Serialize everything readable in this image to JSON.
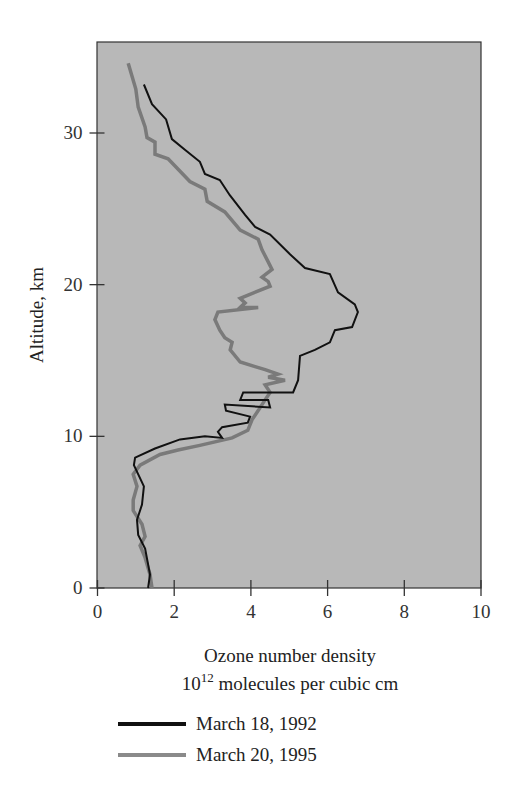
{
  "chart_data": {
    "type": "line",
    "title": "",
    "xlabel": "Ozone number density",
    "xlabel_line2_base": "10",
    "xlabel_line2_exp": "12",
    "xlabel_line2_rest": " molecules per cubic cm",
    "ylabel": "Altitude, km",
    "xlim": [
      0,
      10
    ],
    "ylim": [
      0,
      36
    ],
    "x_ticks": [
      0,
      2,
      4,
      6,
      8,
      10
    ],
    "y_ticks": [
      0,
      10,
      20,
      30
    ],
    "grid": false,
    "background": "#b8b8b8",
    "legend_position": "below",
    "series": [
      {
        "name": "March 18, 1992",
        "color": "#111111",
        "width": 2,
        "points": [
          [
            1.21,
            33.2
          ],
          [
            1.42,
            31.9
          ],
          [
            1.79,
            30.9
          ],
          [
            1.94,
            29.6
          ],
          [
            2.28,
            28.9
          ],
          [
            2.67,
            28.1
          ],
          [
            2.8,
            27.3
          ],
          [
            3.19,
            26.9
          ],
          [
            3.45,
            25.9
          ],
          [
            3.85,
            24.6
          ],
          [
            4.11,
            23.8
          ],
          [
            4.5,
            23.3
          ],
          [
            5.02,
            22.0
          ],
          [
            5.41,
            21.1
          ],
          [
            6.06,
            20.7
          ],
          [
            6.27,
            19.5
          ],
          [
            6.71,
            18.7
          ],
          [
            6.79,
            18.2
          ],
          [
            6.64,
            17.2
          ],
          [
            6.19,
            17.0
          ],
          [
            6.06,
            16.2
          ],
          [
            5.67,
            15.7
          ],
          [
            5.28,
            15.3
          ],
          [
            5.23,
            13.7
          ],
          [
            5.1,
            12.9
          ],
          [
            3.8,
            12.9
          ],
          [
            3.72,
            12.4
          ],
          [
            4.45,
            12.4
          ],
          [
            4.5,
            11.9
          ],
          [
            3.32,
            12.1
          ],
          [
            3.35,
            11.7
          ],
          [
            3.98,
            11.3
          ],
          [
            3.92,
            10.9
          ],
          [
            3.25,
            10.6
          ],
          [
            3.14,
            10.3
          ],
          [
            3.25,
            9.9
          ],
          [
            2.8,
            10.0
          ],
          [
            2.15,
            9.8
          ],
          [
            1.5,
            9.2
          ],
          [
            0.98,
            8.6
          ],
          [
            0.95,
            8.1
          ],
          [
            1.21,
            6.7
          ],
          [
            1.16,
            5.5
          ],
          [
            1.03,
            4.5
          ],
          [
            1.06,
            3.5
          ],
          [
            1.24,
            2.6
          ],
          [
            1.37,
            0.9
          ],
          [
            1.32,
            0
          ]
        ]
      },
      {
        "name": "March 20, 1995",
        "color": "#7a7a7a",
        "width": 3.5,
        "points": [
          [
            0.8,
            34.6
          ],
          [
            1.0,
            32.9
          ],
          [
            1.06,
            31.7
          ],
          [
            1.24,
            30.4
          ],
          [
            1.29,
            29.7
          ],
          [
            1.5,
            29.4
          ],
          [
            1.5,
            28.6
          ],
          [
            1.84,
            28.3
          ],
          [
            2.41,
            26.8
          ],
          [
            2.8,
            26.3
          ],
          [
            2.86,
            25.5
          ],
          [
            3.32,
            24.8
          ],
          [
            3.72,
            23.6
          ],
          [
            4.19,
            23.0
          ],
          [
            4.29,
            22.3
          ],
          [
            4.45,
            21.5
          ],
          [
            4.55,
            21.0
          ],
          [
            4.29,
            20.5
          ],
          [
            4.45,
            20.2
          ],
          [
            4.5,
            19.9
          ],
          [
            3.72,
            19.1
          ],
          [
            3.85,
            18.8
          ],
          [
            3.72,
            18.5
          ],
          [
            4.19,
            18.5
          ],
          [
            3.14,
            18.2
          ],
          [
            3.06,
            17.7
          ],
          [
            3.19,
            17.0
          ],
          [
            3.32,
            16.5
          ],
          [
            3.51,
            16.2
          ],
          [
            3.46,
            15.7
          ],
          [
            3.72,
            14.9
          ],
          [
            4.11,
            14.6
          ],
          [
            4.37,
            14.4
          ],
          [
            4.71,
            14.1
          ],
          [
            4.45,
            13.9
          ],
          [
            4.89,
            13.7
          ],
          [
            4.37,
            13.4
          ],
          [
            4.5,
            12.9
          ],
          [
            4.37,
            12.4
          ],
          [
            4.19,
            11.7
          ],
          [
            4.03,
            11.1
          ],
          [
            3.92,
            10.4
          ],
          [
            3.51,
            9.9
          ],
          [
            2.67,
            9.4
          ],
          [
            2.1,
            9.1
          ],
          [
            1.63,
            8.8
          ],
          [
            1.11,
            8.1
          ],
          [
            0.93,
            7.5
          ],
          [
            1.03,
            6.7
          ],
          [
            0.93,
            5.8
          ],
          [
            0.93,
            5.1
          ],
          [
            1.16,
            4.2
          ],
          [
            1.24,
            3.4
          ],
          [
            1.11,
            2.8
          ],
          [
            1.24,
            2.0
          ],
          [
            1.37,
            0.9
          ],
          [
            1.42,
            0
          ]
        ]
      }
    ]
  },
  "legend": {
    "items": [
      {
        "label": "March 18, 1992",
        "color": "#111111"
      },
      {
        "label": "March 20, 1995",
        "color": "#8a8a8a"
      }
    ]
  }
}
